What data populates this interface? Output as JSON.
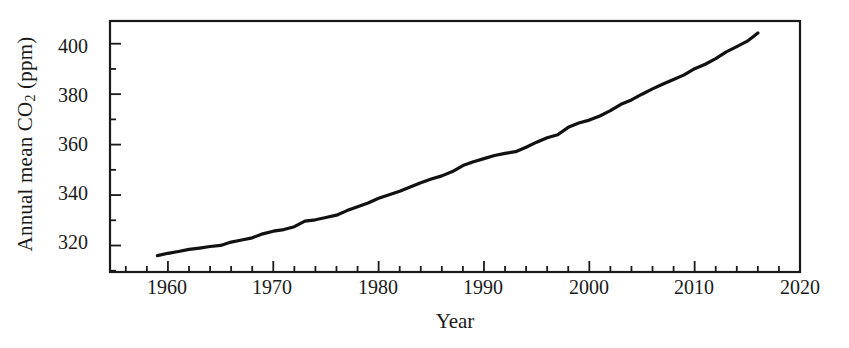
{
  "chart_data": {
    "type": "line",
    "title": "",
    "xlabel": "Year",
    "ylabel": "Annual mean CO2 (ppm)",
    "ylabel_parts": {
      "pre": "Annual mean CO",
      "sub": "2",
      "post": " (ppm)"
    },
    "xlim": [
      1954.5,
      2020
    ],
    "ylim": [
      309.5,
      409
    ],
    "xticks": [
      1960,
      1970,
      1980,
      1990,
      2000,
      2010,
      2020
    ],
    "xtick_labels": [
      "1960",
      "1970",
      "1980",
      "1990",
      "2000",
      "2010",
      "2020"
    ],
    "x_minor_tick_step": 2,
    "yticks": [
      320,
      340,
      360,
      380,
      400
    ],
    "ytick_labels": [
      "320",
      "340",
      "360",
      "380",
      "400"
    ],
    "y_minor_tick_step": 10,
    "grid": false,
    "legend": null,
    "line_color": "#111111",
    "line_width": 3.2,
    "frame": true,
    "x": [
      1959,
      1960,
      1961,
      1962,
      1963,
      1964,
      1965,
      1966,
      1967,
      1968,
      1969,
      1970,
      1971,
      1972,
      1973,
      1974,
      1975,
      1976,
      1977,
      1978,
      1979,
      1980,
      1981,
      1982,
      1983,
      1984,
      1985,
      1986,
      1987,
      1988,
      1989,
      1990,
      1991,
      1992,
      1993,
      1994,
      1995,
      1996,
      1997,
      1998,
      1999,
      2000,
      2001,
      2002,
      2003,
      2004,
      2005,
      2006,
      2007,
      2008,
      2009,
      2010,
      2011,
      2012,
      2013,
      2014,
      2015,
      2016
    ],
    "y": [
      315.98,
      316.91,
      317.64,
      318.45,
      318.99,
      319.62,
      320.04,
      321.37,
      322.18,
      323.05,
      324.62,
      325.68,
      326.32,
      327.46,
      329.68,
      330.19,
      331.12,
      332.03,
      333.84,
      335.41,
      336.84,
      338.76,
      340.12,
      341.48,
      343.15,
      344.85,
      346.35,
      347.61,
      349.31,
      351.69,
      353.2,
      354.45,
      355.7,
      356.54,
      357.21,
      358.96,
      360.97,
      362.74,
      363.88,
      366.84,
      368.54,
      369.71,
      371.32,
      373.45,
      375.98,
      377.7,
      379.98,
      382.09,
      384.02,
      385.83,
      387.64,
      390.1,
      391.85,
      394.06,
      396.74,
      398.87,
      401.01,
      404.22
    ],
    "units": "ppm",
    "series_name": "Annual mean CO2"
  },
  "axes": {
    "plot_left_px": 110,
    "plot_right_px": 800,
    "plot_top_px": 21,
    "plot_bottom_px": 272
  }
}
